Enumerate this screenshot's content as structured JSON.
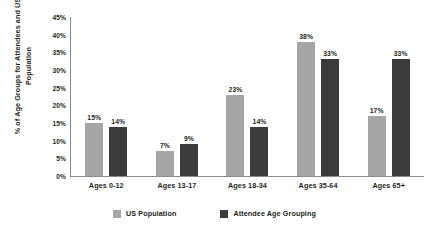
{
  "chart_data": {
    "type": "bar",
    "title": "",
    "xlabel": "",
    "ylabel": "% of Age Groups for Attendees and US Population",
    "categories": [
      "Ages 0-12",
      "Ages 13-17",
      "Ages 18-34",
      "Ages 35-64",
      "Ages 65+"
    ],
    "series": [
      {
        "name": "US Population",
        "color": "#a6a6a6",
        "values": [
          15,
          7,
          23,
          38,
          17
        ],
        "labels": [
          "15%",
          "7%",
          "23%",
          "38%",
          "17%"
        ]
      },
      {
        "name": "Attendee Age Grouping",
        "color": "#3b3b3b",
        "values": [
          14,
          9,
          14,
          33,
          33
        ],
        "labels": [
          "14%",
          "9%",
          "14%",
          "33%",
          "33%"
        ]
      }
    ],
    "ylim": [
      0,
      45
    ],
    "ytick_values": [
      0,
      5,
      10,
      15,
      20,
      25,
      30,
      35,
      40,
      45
    ],
    "ytick_labels": [
      "0%",
      "5%",
      "10%",
      "15%",
      "20%",
      "25%",
      "30%",
      "35%",
      "40%",
      "45%"
    ],
    "grid": false,
    "legend_position": "bottom"
  }
}
